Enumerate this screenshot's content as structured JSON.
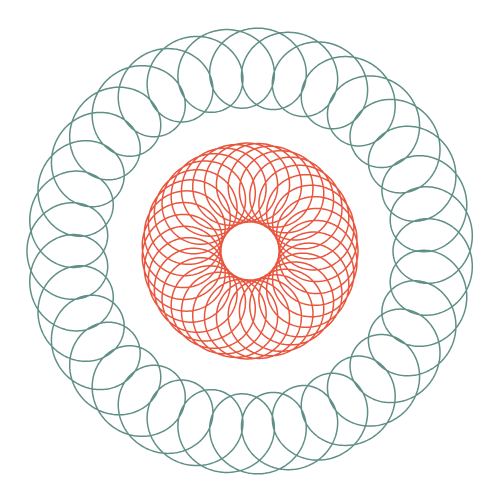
{
  "artwork": {
    "title": "Spirograph Rosette",
    "description": "Concentric guilloche pattern: an outer teal looped ring enclosing an inner orange petal rosette on a white field.",
    "background_color": "#ffffff",
    "canvas": {
      "width": 500,
      "height": 502
    },
    "center": {
      "x": 250,
      "y": 251
    }
  },
  "palette": {
    "teal": "#5f8f86",
    "orange": "#e8563e",
    "background": "#ffffff"
  },
  "chart_data": {
    "type": "line",
    "subtitle": "Two concentric hypotrochoid / epitrochoid curve families",
    "xlabel": "",
    "ylabel": "",
    "grid": false,
    "legend_position": "none",
    "axis_equal": true,
    "xlim": [
      0,
      500
    ],
    "ylim": [
      0,
      502
    ],
    "center": [
      250,
      251
    ],
    "series": [
      {
        "name": "outer-teal-ring",
        "curve_family": "epitrochoid",
        "color": "#5f8f86",
        "stroke_width": 1.5,
        "lobes": 36,
        "R": 183,
        "r": 5.083,
        "d": 40,
        "outer_radius": 223,
        "inner_radius": 143,
        "loop_direction": "inward",
        "samples": 7200,
        "theta_start": 0,
        "theta_end": 360
      },
      {
        "name": "inner-orange-rosette",
        "curve_family": "hypotrochoid",
        "color": "#e8563e",
        "stroke_width": 1.5,
        "petals": 36,
        "R": 108,
        "r": 3.0,
        "d": 79,
        "outer_radius": 108,
        "inner_radius": 29,
        "loop_direction": "outward-tips",
        "samples": 7200,
        "theta_start": 0,
        "theta_end": 360
      }
    ],
    "annotations": []
  },
  "layers": [
    {
      "id": "outer-ring",
      "label": "Outer teal looped ring",
      "color": "#5f8f86",
      "visible": true
    },
    {
      "id": "inner-rosette",
      "label": "Inner orange petal rosette",
      "color": "#e8563e",
      "visible": true
    }
  ]
}
